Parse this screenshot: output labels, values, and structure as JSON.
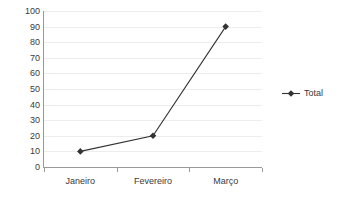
{
  "chart_data": {
    "type": "line",
    "title": "",
    "xlabel": "",
    "ylabel": "",
    "categories": [
      "Janeiro",
      "Fevereiro",
      "Março"
    ],
    "series": [
      {
        "name": "Total",
        "values": [
          10,
          20,
          90
        ],
        "color": "#333333",
        "marker": "diamond"
      }
    ],
    "ylim": [
      0,
      100
    ],
    "ytick_step": 10,
    "yticks": [
      0,
      10,
      20,
      30,
      40,
      50,
      60,
      70,
      80,
      90,
      100
    ],
    "ytick_labels": [
      "0",
      "10",
      "20",
      "30",
      "40",
      "50",
      "60",
      "70",
      "80",
      "90",
      "100"
    ],
    "grid": {
      "horizontal": true,
      "vertical": false,
      "color": "#ededed"
    },
    "legend": {
      "position": "right",
      "entries": [
        "Total"
      ]
    },
    "axis_color": "#9a9a9a",
    "background": "#ffffff"
  }
}
